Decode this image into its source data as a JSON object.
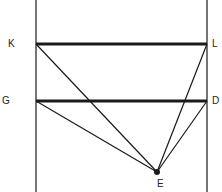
{
  "diagram": {
    "labels": {
      "K": "K",
      "L": "L",
      "G": "G",
      "D": "D",
      "E": "E"
    },
    "points": {
      "K": [
        36,
        44
      ],
      "L": [
        207,
        44
      ],
      "G": [
        36,
        101
      ],
      "D": [
        207,
        101
      ],
      "E": [
        157,
        172
      ]
    },
    "colors": {
      "line": "#1a1a1a",
      "background": "#ffffff"
    }
  }
}
